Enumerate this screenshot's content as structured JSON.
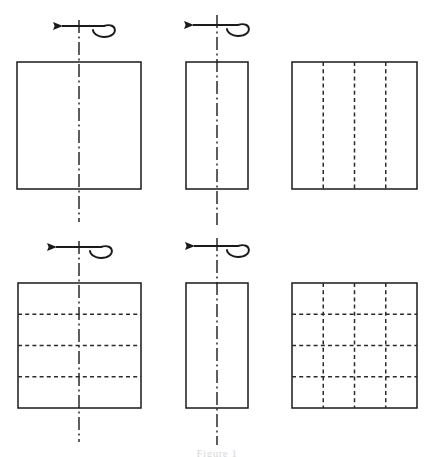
{
  "figure": {
    "caption": "Figure 1",
    "canvas": {
      "width": 434,
      "height": 457,
      "background": "#ffffff"
    },
    "stroke_color": "#1a1a1a",
    "dashed_color": "#2b2b2b",
    "axis_color": "#1a1a1a",
    "panels": [
      {
        "id": "panel-top-left",
        "name": "square-no-subdivision",
        "row": 0,
        "col": 0,
        "shape": "rectangle",
        "x": 17,
        "y": 62,
        "width": 124,
        "height": 127,
        "vertical_dashed_lines": 0,
        "horizontal_dashed_lines": 0,
        "has_rotation_axis": true,
        "axis_top": 20,
        "axis_bottom": 222,
        "axis_x": 79,
        "rotation_arrow": {
          "direction": "left",
          "style": "curved-loop",
          "cy": 26
        }
      },
      {
        "id": "panel-top-middle",
        "name": "tall-rectangle-no-subdivision",
        "row": 0,
        "col": 1,
        "shape": "rectangle",
        "x": 186,
        "y": 62,
        "width": 62,
        "height": 127,
        "vertical_dashed_lines": 0,
        "horizontal_dashed_lines": 0,
        "has_rotation_axis": true,
        "axis_top": 15,
        "axis_bottom": 225,
        "axis_x": 217,
        "rotation_arrow": {
          "direction": "left",
          "style": "curved-loop",
          "cy": 26
        }
      },
      {
        "id": "panel-top-right",
        "name": "square-four-vertical-columns",
        "row": 0,
        "col": 2,
        "shape": "rectangle",
        "x": 292,
        "y": 62,
        "width": 125,
        "height": 127,
        "vertical_dashed_lines": 3,
        "horizontal_dashed_lines": 0,
        "has_rotation_axis": false,
        "rotation_arrow": null
      },
      {
        "id": "panel-bottom-left",
        "name": "square-four-horizontal-rows",
        "row": 1,
        "col": 0,
        "shape": "rectangle",
        "x": 18,
        "y": 283,
        "width": 123,
        "height": 125,
        "vertical_dashed_lines": 0,
        "horizontal_dashed_lines": 3,
        "has_rotation_axis": true,
        "axis_top": 241,
        "axis_bottom": 442,
        "axis_x": 79,
        "rotation_arrow": {
          "direction": "left",
          "style": "curved-loop",
          "cy": 247
        }
      },
      {
        "id": "panel-bottom-middle",
        "name": "tall-rectangle-no-subdivision-lower",
        "row": 1,
        "col": 1,
        "shape": "rectangle",
        "x": 186,
        "y": 283,
        "width": 62,
        "height": 125,
        "vertical_dashed_lines": 0,
        "horizontal_dashed_lines": 0,
        "has_rotation_axis": true,
        "axis_top": 238,
        "axis_bottom": 445,
        "axis_x": 217,
        "rotation_arrow": {
          "direction": "left",
          "style": "curved-loop",
          "cy": 247
        }
      },
      {
        "id": "panel-bottom-right",
        "name": "square-four-by-four-grid",
        "row": 1,
        "col": 2,
        "shape": "rectangle",
        "x": 292,
        "y": 283,
        "width": 125,
        "height": 125,
        "vertical_dashed_lines": 3,
        "horizontal_dashed_lines": 3,
        "has_rotation_axis": false,
        "rotation_arrow": null
      }
    ]
  }
}
